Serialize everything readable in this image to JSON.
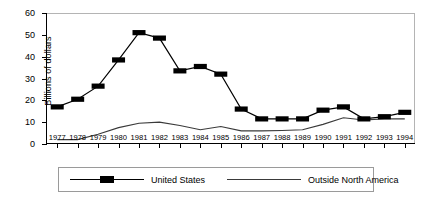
{
  "chart_data": {
    "type": "line",
    "title": "",
    "xlabel": "",
    "ylabel": "Billions of dollars",
    "x": [
      1977,
      1978,
      1979,
      1980,
      1981,
      1982,
      1983,
      1984,
      1985,
      1986,
      1987,
      1988,
      1989,
      1990,
      1991,
      1992,
      1993,
      1994
    ],
    "categories": [
      "1977",
      "1978",
      "1979",
      "1980",
      "1981",
      "1982",
      "1983",
      "1984",
      "1985",
      "1986",
      "1987",
      "1988",
      "1989",
      "1990",
      "1991",
      "1992",
      "1993",
      "1994"
    ],
    "ylim": [
      0,
      60
    ],
    "yticks": [
      0,
      10,
      20,
      30,
      40,
      50,
      60
    ],
    "ytick_labels": [
      "0",
      "10",
      "20",
      "30",
      "40",
      "50",
      "60"
    ],
    "grid": false,
    "legend_position": "bottom",
    "series": [
      {
        "name": "United States",
        "marker": "filled-square",
        "color": "#000000",
        "values": [
          17,
          20.5,
          26.5,
          38.5,
          51,
          48.5,
          33.5,
          35.5,
          32,
          16,
          11.5,
          11.5,
          11.5,
          15.5,
          17,
          11.5,
          12.5,
          14.5
        ]
      },
      {
        "name": "Outside North America",
        "marker": "none",
        "color": "#3a3a3a",
        "values": [
          2,
          2,
          4.5,
          7.5,
          9.5,
          10,
          8.5,
          6.5,
          8,
          6,
          6,
          6.2,
          6.5,
          9,
          12,
          11,
          11.5,
          11.5
        ]
      }
    ]
  },
  "legend": {
    "items": [
      {
        "label": "United States"
      },
      {
        "label": "Outside North America"
      }
    ]
  }
}
